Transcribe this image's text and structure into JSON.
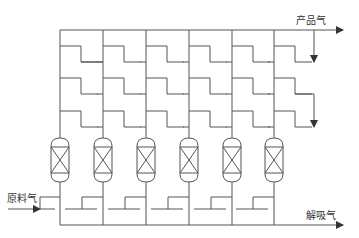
{
  "labels": {
    "product_gas": "产品气",
    "feed_gas": "原料气",
    "desorption_gas": "解吸气"
  },
  "colors": {
    "line": "#555555",
    "background": "#ffffff",
    "text": "#333333"
  },
  "diagram": {
    "type": "PSA process flow (6 adsorption towers)",
    "column_count": 6,
    "columns_x": [
      60,
      103,
      146,
      189,
      232,
      274
    ],
    "top_header_y": 30,
    "top_rows_y": [
      62,
      94,
      127
    ],
    "bottom_header_y": 225,
    "feed_line_y": 209,
    "vessels": [
      {
        "id": "tower-1"
      },
      {
        "id": "tower-2"
      },
      {
        "id": "tower-3"
      },
      {
        "id": "tower-4"
      },
      {
        "id": "tower-5"
      },
      {
        "id": "tower-6"
      }
    ]
  }
}
